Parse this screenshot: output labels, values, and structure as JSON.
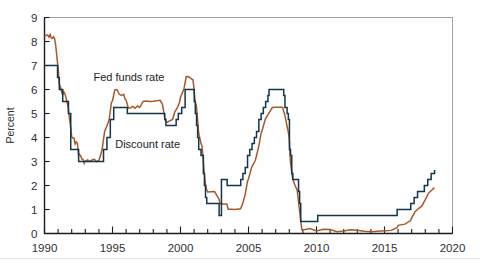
{
  "figure": {
    "kind": "line-chart",
    "background_color": "#ffffff"
  },
  "chart_data": {
    "type": "line",
    "title": "",
    "xlabel": "",
    "ylabel": "Percent",
    "xlim": [
      1990,
      2020
    ],
    "ylim": [
      0,
      9
    ],
    "yticks": [
      0,
      1,
      2,
      3,
      4,
      5,
      6,
      7,
      8,
      9
    ],
    "ytick_labels": [
      "0",
      "1",
      "2",
      "3",
      "4",
      "5",
      "6",
      "7",
      "8",
      "9"
    ],
    "xticks": [
      1990,
      1995,
      2000,
      2005,
      2010,
      2015,
      2020
    ],
    "xtick_labels": [
      "1990",
      "1995",
      "2000",
      "2005",
      "2010",
      "2015",
      "2020"
    ],
    "x_minor_tick_interval": 1,
    "grid": false,
    "legend_position": "inline-annotation",
    "annotations": [
      {
        "text": "Fed funds rate",
        "x": 1993.6,
        "y": 6.35,
        "color": "#8a4b24"
      },
      {
        "text": "Discount rate",
        "x": 1995.2,
        "y": 3.55,
        "color": "#1b3a4e"
      }
    ],
    "series": [
      {
        "name": "Fed funds rate",
        "color": "#a65a2a",
        "step": false,
        "points": [
          [
            1990.0,
            8.23
          ],
          [
            1990.08,
            8.24
          ],
          [
            1990.17,
            8.28
          ],
          [
            1990.25,
            8.26
          ],
          [
            1990.33,
            8.18
          ],
          [
            1990.42,
            8.29
          ],
          [
            1990.5,
            8.15
          ],
          [
            1990.58,
            8.13
          ],
          [
            1990.67,
            8.2
          ],
          [
            1990.75,
            8.11
          ],
          [
            1990.83,
            7.81
          ],
          [
            1990.92,
            7.31
          ],
          [
            1991.0,
            6.91
          ],
          [
            1991.08,
            6.25
          ],
          [
            1991.17,
            6.12
          ],
          [
            1991.25,
            5.91
          ],
          [
            1991.33,
            5.78
          ],
          [
            1991.42,
            5.9
          ],
          [
            1991.5,
            5.82
          ],
          [
            1991.58,
            5.66
          ],
          [
            1991.67,
            5.45
          ],
          [
            1991.75,
            5.21
          ],
          [
            1991.83,
            4.81
          ],
          [
            1991.92,
            4.43
          ],
          [
            1992.0,
            4.03
          ],
          [
            1992.08,
            3.98
          ],
          [
            1992.17,
            3.98
          ],
          [
            1992.25,
            3.73
          ],
          [
            1992.33,
            3.82
          ],
          [
            1992.42,
            3.76
          ],
          [
            1992.5,
            3.25
          ],
          [
            1992.58,
            3.3
          ],
          [
            1992.67,
            3.22
          ],
          [
            1992.75,
            3.1
          ],
          [
            1992.83,
            3.09
          ],
          [
            1992.92,
            2.92
          ],
          [
            1993.0,
            3.02
          ],
          [
            1993.17,
            3.07
          ],
          [
            1993.33,
            3.0
          ],
          [
            1993.5,
            3.06
          ],
          [
            1993.67,
            3.09
          ],
          [
            1993.83,
            2.99
          ],
          [
            1994.0,
            3.05
          ],
          [
            1994.17,
            3.34
          ],
          [
            1994.25,
            3.56
          ],
          [
            1994.42,
            4.25
          ],
          [
            1994.58,
            4.47
          ],
          [
            1994.75,
            4.73
          ],
          [
            1994.92,
            5.45
          ],
          [
            1995.0,
            5.53
          ],
          [
            1995.17,
            5.98
          ],
          [
            1995.33,
            6.0
          ],
          [
            1995.5,
            5.8
          ],
          [
            1995.67,
            5.75
          ],
          [
            1995.83,
            5.8
          ],
          [
            1995.92,
            5.6
          ],
          [
            1996.0,
            5.56
          ],
          [
            1996.17,
            5.22
          ],
          [
            1996.33,
            5.24
          ],
          [
            1996.5,
            5.3
          ],
          [
            1996.67,
            5.22
          ],
          [
            1996.83,
            5.31
          ],
          [
            1997.0,
            5.25
          ],
          [
            1997.25,
            5.5
          ],
          [
            1997.5,
            5.52
          ],
          [
            1997.75,
            5.5
          ],
          [
            1998.0,
            5.51
          ],
          [
            1998.5,
            5.55
          ],
          [
            1998.67,
            5.38
          ],
          [
            1998.83,
            4.86
          ],
          [
            1998.92,
            4.68
          ],
          [
            1999.0,
            4.63
          ],
          [
            1999.42,
            4.75
          ],
          [
            1999.58,
            5.07
          ],
          [
            1999.75,
            5.22
          ],
          [
            1999.92,
            5.45
          ],
          [
            2000.0,
            5.68
          ],
          [
            2000.25,
            6.02
          ],
          [
            2000.42,
            6.53
          ],
          [
            2000.58,
            6.54
          ],
          [
            2000.92,
            6.4
          ],
          [
            2001.0,
            5.98
          ],
          [
            2001.08,
            5.49
          ],
          [
            2001.17,
            5.31
          ],
          [
            2001.25,
            4.8
          ],
          [
            2001.33,
            4.21
          ],
          [
            2001.42,
            3.97
          ],
          [
            2001.5,
            3.77
          ],
          [
            2001.58,
            3.65
          ],
          [
            2001.67,
            3.07
          ],
          [
            2001.75,
            2.49
          ],
          [
            2001.83,
            2.09
          ],
          [
            2001.92,
            1.82
          ],
          [
            2002.0,
            1.73
          ],
          [
            2002.5,
            1.75
          ],
          [
            2002.83,
            1.44
          ],
          [
            2002.92,
            1.24
          ],
          [
            2003.0,
            1.24
          ],
          [
            2003.42,
            1.22
          ],
          [
            2003.5,
            1.01
          ],
          [
            2003.75,
            1.01
          ],
          [
            2004.0,
            1.0
          ],
          [
            2004.42,
            1.03
          ],
          [
            2004.58,
            1.26
          ],
          [
            2004.75,
            1.61
          ],
          [
            2004.92,
            2.16
          ],
          [
            2005.0,
            2.28
          ],
          [
            2005.25,
            2.79
          ],
          [
            2005.5,
            3.04
          ],
          [
            2005.75,
            3.62
          ],
          [
            2005.92,
            4.16
          ],
          [
            2006.0,
            4.29
          ],
          [
            2006.25,
            4.79
          ],
          [
            2006.5,
            5.02
          ],
          [
            2006.75,
            5.25
          ],
          [
            2007.0,
            5.26
          ],
          [
            2007.5,
            5.26
          ],
          [
            2007.67,
            4.94
          ],
          [
            2007.83,
            4.49
          ],
          [
            2007.92,
            4.24
          ],
          [
            2008.0,
            3.94
          ],
          [
            2008.08,
            2.98
          ],
          [
            2008.17,
            2.61
          ],
          [
            2008.25,
            2.28
          ],
          [
            2008.42,
            2.0
          ],
          [
            2008.58,
            1.81
          ],
          [
            2008.75,
            0.97
          ],
          [
            2008.92,
            0.16
          ],
          [
            2009.0,
            0.15
          ],
          [
            2009.5,
            0.21
          ],
          [
            2010.0,
            0.11
          ],
          [
            2010.5,
            0.18
          ],
          [
            2011.0,
            0.17
          ],
          [
            2011.5,
            0.07
          ],
          [
            2012.0,
            0.1
          ],
          [
            2012.5,
            0.16
          ],
          [
            2013.0,
            0.14
          ],
          [
            2013.5,
            0.09
          ],
          [
            2014.0,
            0.07
          ],
          [
            2014.5,
            0.09
          ],
          [
            2015.0,
            0.11
          ],
          [
            2015.5,
            0.13
          ],
          [
            2015.92,
            0.24
          ],
          [
            2016.0,
            0.34
          ],
          [
            2016.5,
            0.39
          ],
          [
            2016.92,
            0.54
          ],
          [
            2017.0,
            0.65
          ],
          [
            2017.25,
            0.91
          ],
          [
            2017.5,
            1.04
          ],
          [
            2017.75,
            1.15
          ],
          [
            2018.0,
            1.41
          ],
          [
            2018.25,
            1.69
          ],
          [
            2018.5,
            1.82
          ],
          [
            2018.67,
            1.91
          ]
        ]
      },
      {
        "name": "Discount rate",
        "color": "#13364a",
        "step": true,
        "points": [
          [
            1990.0,
            7.0
          ],
          [
            1990.95,
            7.0
          ],
          [
            1990.96,
            6.5
          ],
          [
            1991.08,
            6.5
          ],
          [
            1991.09,
            6.0
          ],
          [
            1991.33,
            6.0
          ],
          [
            1991.34,
            5.5
          ],
          [
            1991.75,
            5.5
          ],
          [
            1991.76,
            5.0
          ],
          [
            1991.92,
            5.0
          ],
          [
            1991.93,
            3.5
          ],
          [
            1992.5,
            3.5
          ],
          [
            1992.51,
            3.0
          ],
          [
            1994.33,
            3.0
          ],
          [
            1994.34,
            3.5
          ],
          [
            1994.58,
            3.5
          ],
          [
            1994.59,
            4.0
          ],
          [
            1994.83,
            4.0
          ],
          [
            1994.84,
            4.75
          ],
          [
            1995.08,
            4.75
          ],
          [
            1995.09,
            5.25
          ],
          [
            1996.08,
            5.25
          ],
          [
            1996.09,
            5.0
          ],
          [
            1998.83,
            5.0
          ],
          [
            1998.84,
            4.75
          ],
          [
            1998.92,
            4.75
          ],
          [
            1998.93,
            4.5
          ],
          [
            1999.67,
            4.5
          ],
          [
            1999.68,
            4.75
          ],
          [
            1999.83,
            4.75
          ],
          [
            1999.84,
            5.0
          ],
          [
            2000.08,
            5.0
          ],
          [
            2000.09,
            5.25
          ],
          [
            2000.33,
            5.25
          ],
          [
            2000.34,
            6.0
          ],
          [
            2001.0,
            6.0
          ],
          [
            2001.01,
            5.5
          ],
          [
            2001.08,
            5.5
          ],
          [
            2001.09,
            5.0
          ],
          [
            2001.17,
            5.0
          ],
          [
            2001.18,
            4.5
          ],
          [
            2001.25,
            4.5
          ],
          [
            2001.26,
            4.0
          ],
          [
            2001.33,
            4.0
          ],
          [
            2001.34,
            3.5
          ],
          [
            2001.5,
            3.5
          ],
          [
            2001.51,
            3.25
          ],
          [
            2001.67,
            3.25
          ],
          [
            2001.68,
            2.5
          ],
          [
            2001.75,
            2.5
          ],
          [
            2001.76,
            2.0
          ],
          [
            2001.83,
            2.0
          ],
          [
            2001.84,
            1.5
          ],
          [
            2001.92,
            1.5
          ],
          [
            2001.93,
            1.25
          ],
          [
            2002.83,
            1.25
          ],
          [
            2002.84,
            0.75
          ],
          [
            2003.0,
            0.75
          ],
          [
            2003.01,
            2.25
          ],
          [
            2003.42,
            2.25
          ],
          [
            2003.43,
            2.0
          ],
          [
            2004.42,
            2.0
          ],
          [
            2004.43,
            2.25
          ],
          [
            2004.58,
            2.25
          ],
          [
            2004.59,
            2.5
          ],
          [
            2004.75,
            2.5
          ],
          [
            2004.76,
            2.75
          ],
          [
            2004.92,
            2.75
          ],
          [
            2004.93,
            3.25
          ],
          [
            2005.08,
            3.25
          ],
          [
            2005.09,
            3.5
          ],
          [
            2005.25,
            3.5
          ],
          [
            2005.26,
            3.75
          ],
          [
            2005.42,
            3.75
          ],
          [
            2005.43,
            4.0
          ],
          [
            2005.58,
            4.0
          ],
          [
            2005.59,
            4.25
          ],
          [
            2005.75,
            4.25
          ],
          [
            2005.76,
            4.75
          ],
          [
            2005.92,
            4.75
          ],
          [
            2005.93,
            5.0
          ],
          [
            2006.08,
            5.0
          ],
          [
            2006.09,
            5.25
          ],
          [
            2006.25,
            5.25
          ],
          [
            2006.26,
            5.5
          ],
          [
            2006.42,
            5.5
          ],
          [
            2006.43,
            5.75
          ],
          [
            2006.5,
            5.75
          ],
          [
            2006.51,
            6.0
          ],
          [
            2007.58,
            6.0
          ],
          [
            2007.59,
            5.75
          ],
          [
            2007.67,
            5.75
          ],
          [
            2007.68,
            5.25
          ],
          [
            2007.83,
            5.25
          ],
          [
            2007.84,
            5.0
          ],
          [
            2007.92,
            5.0
          ],
          [
            2007.93,
            4.75
          ],
          [
            2008.0,
            4.75
          ],
          [
            2008.01,
            3.5
          ],
          [
            2008.08,
            3.5
          ],
          [
            2008.09,
            3.25
          ],
          [
            2008.17,
            3.25
          ],
          [
            2008.18,
            2.5
          ],
          [
            2008.25,
            2.5
          ],
          [
            2008.26,
            2.25
          ],
          [
            2008.42,
            2.25
          ],
          [
            2008.43,
            2.25
          ],
          [
            2008.67,
            2.25
          ],
          [
            2008.68,
            1.75
          ],
          [
            2008.75,
            1.75
          ],
          [
            2008.76,
            1.25
          ],
          [
            2008.83,
            1.25
          ],
          [
            2008.84,
            0.5
          ],
          [
            2010.08,
            0.5
          ],
          [
            2010.09,
            0.75
          ],
          [
            2015.92,
            0.75
          ],
          [
            2015.93,
            1.0
          ],
          [
            2016.92,
            1.0
          ],
          [
            2016.93,
            1.25
          ],
          [
            2017.17,
            1.25
          ],
          [
            2017.18,
            1.5
          ],
          [
            2017.42,
            1.5
          ],
          [
            2017.43,
            1.75
          ],
          [
            2017.92,
            1.75
          ],
          [
            2017.93,
            2.0
          ],
          [
            2018.17,
            2.0
          ],
          [
            2018.18,
            2.25
          ],
          [
            2018.42,
            2.25
          ],
          [
            2018.43,
            2.5
          ],
          [
            2018.67,
            2.5
          ],
          [
            2018.68,
            2.65
          ]
        ]
      }
    ]
  }
}
